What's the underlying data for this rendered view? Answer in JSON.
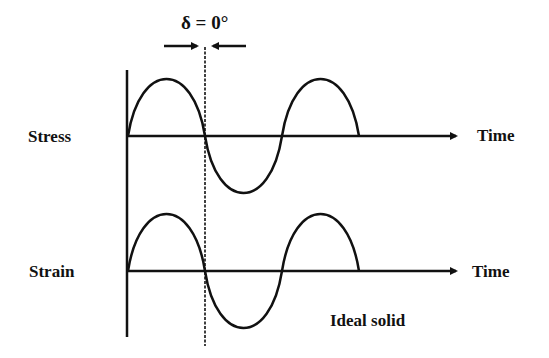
{
  "diagram": {
    "phase_label": "δ = 0°",
    "signals": [
      {
        "name": "Stress",
        "axis_label": "Time"
      },
      {
        "name": "Strain",
        "axis_label": "Time"
      }
    ],
    "caption": "Ideal solid",
    "colors": {
      "line": "#111111",
      "background": "#ffffff"
    }
  }
}
